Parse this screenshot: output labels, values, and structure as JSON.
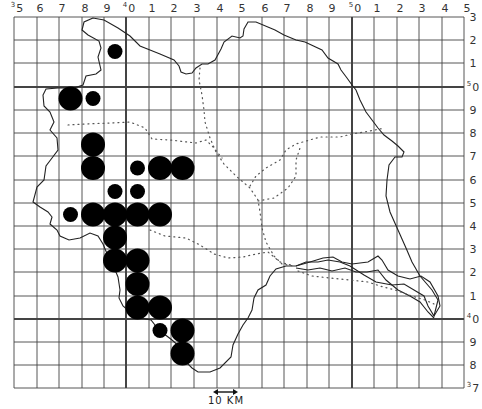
{
  "map": {
    "title": "",
    "grid": {
      "x_lines": [
        14,
        37,
        59,
        82,
        104,
        126,
        149,
        171,
        194,
        217,
        239,
        262,
        284,
        307,
        329,
        352,
        374,
        397,
        419,
        442,
        464
      ],
      "y_lines": [
        17,
        40,
        63,
        87,
        110,
        133,
        156,
        180,
        203,
        226,
        249,
        272,
        296,
        319,
        342,
        365,
        388
      ],
      "bold_x_lines": [
        126,
        352
      ],
      "bold_y_lines": [
        87,
        319
      ],
      "line_color": "#444444"
    },
    "top_labels": [
      {
        "text": "5",
        "prefix": "3",
        "x": 14
      },
      {
        "text": "6",
        "x": 37
      },
      {
        "text": "7",
        "x": 59
      },
      {
        "text": "8",
        "x": 82
      },
      {
        "text": "9",
        "x": 104
      },
      {
        "text": "0",
        "prefix": "4",
        "x": 126
      },
      {
        "text": "1",
        "x": 149
      },
      {
        "text": "2",
        "x": 171
      },
      {
        "text": "3",
        "x": 194
      },
      {
        "text": "4",
        "x": 217
      },
      {
        "text": "5",
        "x": 239
      },
      {
        "text": "6",
        "x": 262
      },
      {
        "text": "7",
        "x": 284
      },
      {
        "text": "8",
        "x": 307
      },
      {
        "text": "9",
        "x": 329
      },
      {
        "text": "0",
        "prefix": "5",
        "x": 352
      },
      {
        "text": "1",
        "x": 374
      },
      {
        "text": "2",
        "x": 397
      },
      {
        "text": "3",
        "x": 419
      },
      {
        "text": "4",
        "x": 442
      },
      {
        "text": "5",
        "x": 464
      }
    ],
    "right_labels": [
      {
        "text": "3",
        "y": 17
      },
      {
        "text": "2",
        "y": 40
      },
      {
        "text": "1",
        "y": 63
      },
      {
        "text": "0",
        "prefix": "5",
        "y": 87
      },
      {
        "text": "9",
        "y": 110
      },
      {
        "text": "8",
        "y": 133
      },
      {
        "text": "7",
        "y": 156
      },
      {
        "text": "6",
        "y": 180
      },
      {
        "text": "5",
        "y": 203
      },
      {
        "text": "4",
        "y": 226
      },
      {
        "text": "3",
        "y": 249
      },
      {
        "text": "2",
        "y": 272
      },
      {
        "text": "1",
        "y": 296
      },
      {
        "text": "0",
        "prefix": "4",
        "y": 319
      },
      {
        "text": "9",
        "y": 342
      },
      {
        "text": "8",
        "y": 365
      },
      {
        "text": "7",
        "prefix": "3",
        "y": 388
      }
    ],
    "records": [
      {
        "col": 4,
        "row": 1,
        "size": "small"
      },
      {
        "col": 2,
        "row": 3,
        "size": "large"
      },
      {
        "col": 3,
        "row": 3,
        "size": "small"
      },
      {
        "col": 3,
        "row": 5,
        "size": "large"
      },
      {
        "col": 3,
        "row": 6,
        "size": "large"
      },
      {
        "col": 5,
        "row": 6,
        "size": "small"
      },
      {
        "col": 6,
        "row": 6,
        "size": "large"
      },
      {
        "col": 7,
        "row": 6,
        "size": "large"
      },
      {
        "col": 4,
        "row": 7,
        "size": "small"
      },
      {
        "col": 5,
        "row": 7,
        "size": "small"
      },
      {
        "col": 2,
        "row": 8,
        "size": "small"
      },
      {
        "col": 3,
        "row": 8,
        "size": "large"
      },
      {
        "col": 4,
        "row": 8,
        "size": "large"
      },
      {
        "col": 5,
        "row": 8,
        "size": "large"
      },
      {
        "col": 6,
        "row": 8,
        "size": "large"
      },
      {
        "col": 4,
        "row": 9,
        "size": "large"
      },
      {
        "col": 4,
        "row": 10,
        "size": "large"
      },
      {
        "col": 5,
        "row": 10,
        "size": "large"
      },
      {
        "col": 5,
        "row": 11,
        "size": "large"
      },
      {
        "col": 5,
        "row": 12,
        "size": "large"
      },
      {
        "col": 6,
        "row": 12,
        "size": "large"
      },
      {
        "col": 6,
        "row": 13,
        "size": "small"
      },
      {
        "col": 7,
        "row": 13,
        "size": "large"
      },
      {
        "col": 7,
        "row": 14,
        "size": "large"
      }
    ],
    "dot_radius": {
      "large": 12,
      "small": 7.5
    },
    "dot_color": "#000000",
    "scale_bar": {
      "label": "10 KM"
    }
  }
}
